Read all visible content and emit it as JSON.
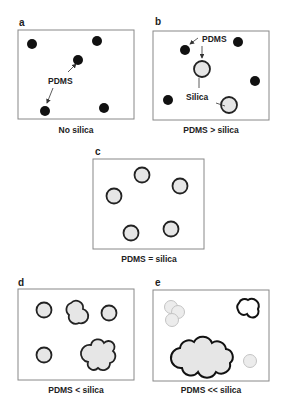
{
  "figure": {
    "panels": [
      {
        "id": "a",
        "label": "a",
        "caption": "No silica",
        "annotations": [
          "PDMS"
        ]
      },
      {
        "id": "b",
        "label": "b",
        "caption": "PDMS > silica",
        "annotations": [
          "PDMS",
          "Silica"
        ]
      },
      {
        "id": "c",
        "label": "c",
        "caption": "PDMS = silica",
        "annotations": []
      },
      {
        "id": "d",
        "label": "d",
        "caption": "PDMS < silica",
        "annotations": []
      },
      {
        "id": "e",
        "label": "e",
        "caption": "PDMS << silica",
        "annotations": []
      }
    ],
    "colors": {
      "pdms": "#111111",
      "silica_fill": "#e6e6e6",
      "silica_stroke": "#222222",
      "faint_fill": "#ececec",
      "faint_stroke": "#c4c4c4",
      "frame": "#888888"
    }
  }
}
